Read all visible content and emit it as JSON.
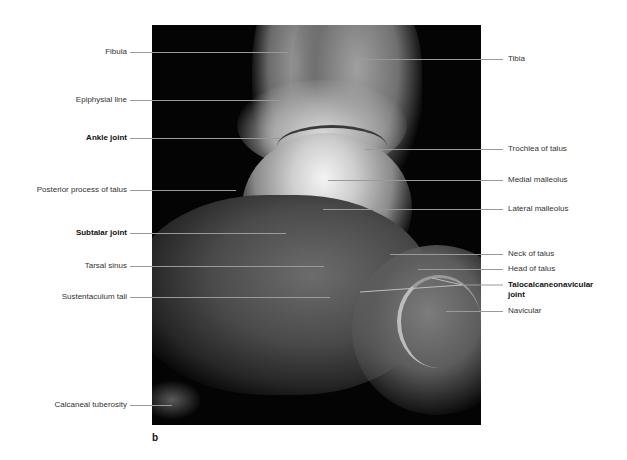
{
  "figure": {
    "panel_letter": "b",
    "image_description": "Lateral radiograph of the ankle and hindfoot",
    "labels_left": [
      {
        "text": "Fibula",
        "bold": false
      },
      {
        "text": "Epiphysial line",
        "bold": false
      },
      {
        "text": "Ankle joint",
        "bold": true
      },
      {
        "text": "Posterior process of talus",
        "bold": false
      },
      {
        "text": "Subtalar joint",
        "bold": true
      },
      {
        "text": "Tarsal sinus",
        "bold": false
      },
      {
        "text": "Sustentaculum tali",
        "bold": false
      },
      {
        "text": "Calcaneal tuberosity",
        "bold": false
      }
    ],
    "labels_right": [
      {
        "text": "Tibia",
        "bold": false
      },
      {
        "text": "Trochlea of talus",
        "bold": false
      },
      {
        "text": "Medial malleolus",
        "bold": false
      },
      {
        "text": "Lateral malleolus",
        "bold": false
      },
      {
        "text": "Neck of talus",
        "bold": false
      },
      {
        "text": "Head of talus",
        "bold": false
      },
      {
        "text": "Talocalcaneonavicular joint",
        "line1": "Talocalcaneonavicular",
        "line2": "joint",
        "bold": true
      },
      {
        "text": "Navicular",
        "bold": false
      }
    ]
  }
}
